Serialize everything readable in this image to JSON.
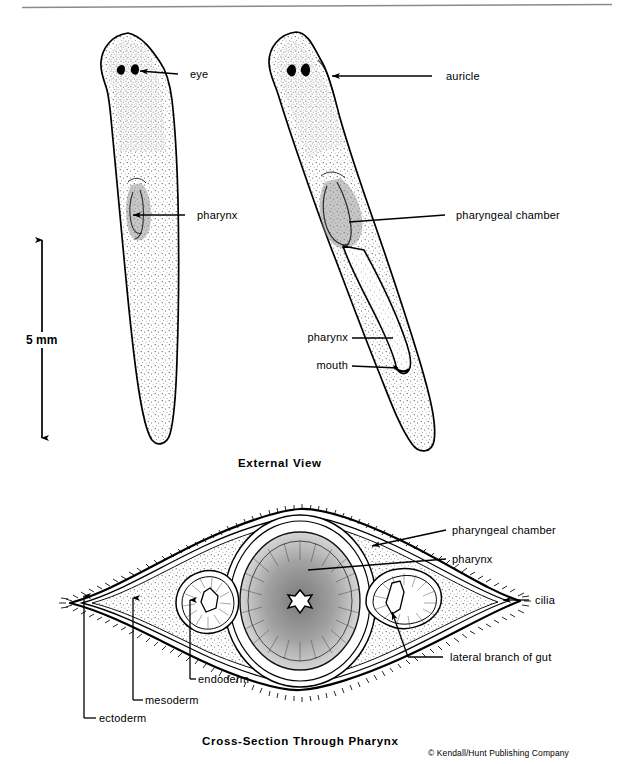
{
  "figure": {
    "top_rule": true,
    "external_view": {
      "caption": "External  View",
      "labels": {
        "eye": "eye",
        "pharynx_left": "pharynx",
        "auricle": "auricle",
        "pharyngeal_chamber": "pharyngeal  chamber",
        "pharynx_protruded": "pharynx",
        "mouth": "mouth"
      },
      "scale_bar": {
        "value": "5 mm"
      }
    },
    "cross_section": {
      "caption": "Cross-Section  Through  Pharynx",
      "labels": {
        "pharyngeal_chamber": "pharyngeal  chamber",
        "pharynx": "pharynx",
        "cilia": "cilia",
        "lateral_branch_of_gut": "lateral  branch  of  gut",
        "endoderm": "endoderm",
        "mesoderm": "mesoderm",
        "ectoderm": "ectoderm"
      }
    },
    "copyright": "© Kendall/Hunt Publishing Company",
    "colors": {
      "ink": "#000000",
      "paper": "#ffffff",
      "rule": "#8a8a8a",
      "stipple": "#2b2b2b"
    }
  }
}
